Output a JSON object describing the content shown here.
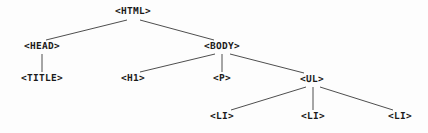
{
  "diagram": {
    "type": "tree",
    "width": 428,
    "height": 133,
    "background_color": "#fdfdfd",
    "line_color": "#3a3a3a",
    "text_color": "#1a1a1a",
    "nodes": [
      {
        "id": "html",
        "label": "<HTML>",
        "x": 133,
        "y": 12,
        "depth": 0
      },
      {
        "id": "head",
        "label": "<HEAD>",
        "x": 42,
        "y": 47,
        "depth": 1
      },
      {
        "id": "body",
        "label": "<BODY>",
        "x": 222,
        "y": 47,
        "depth": 1
      },
      {
        "id": "title",
        "label": "<TITLE>",
        "x": 42,
        "y": 79,
        "depth": 2
      },
      {
        "id": "h1",
        "label": "<H1>",
        "x": 133,
        "y": 79,
        "depth": 2
      },
      {
        "id": "p",
        "label": "<P>",
        "x": 222,
        "y": 79,
        "depth": 2
      },
      {
        "id": "ul",
        "label": "<UL>",
        "x": 312,
        "y": 80,
        "depth": 2
      },
      {
        "id": "li1",
        "label": "<LI>",
        "x": 222,
        "y": 117,
        "depth": 3
      },
      {
        "id": "li2",
        "label": "<LI>",
        "x": 313,
        "y": 117,
        "depth": 3
      },
      {
        "id": "li3",
        "label": "<LI>",
        "x": 400,
        "y": 117,
        "depth": 3
      }
    ],
    "edges": [
      {
        "from": "html",
        "to": "head",
        "x1": 127,
        "y1": 20,
        "x2": 46,
        "y2": 40
      },
      {
        "from": "html",
        "to": "body",
        "x1": 140,
        "y1": 20,
        "x2": 214,
        "y2": 40
      },
      {
        "from": "head",
        "to": "title",
        "x1": 42,
        "y1": 54,
        "x2": 42,
        "y2": 72
      },
      {
        "from": "body",
        "to": "h1",
        "x1": 215,
        "y1": 54,
        "x2": 140,
        "y2": 72
      },
      {
        "from": "body",
        "to": "p",
        "x1": 222,
        "y1": 54,
        "x2": 222,
        "y2": 72
      },
      {
        "from": "body",
        "to": "ul",
        "x1": 230,
        "y1": 54,
        "x2": 304,
        "y2": 73
      },
      {
        "from": "ul",
        "to": "li1",
        "x1": 306,
        "y1": 87,
        "x2": 231,
        "y2": 110
      },
      {
        "from": "ul",
        "to": "li2",
        "x1": 313,
        "y1": 87,
        "x2": 313,
        "y2": 110
      },
      {
        "from": "ul",
        "to": "li3",
        "x1": 320,
        "y1": 87,
        "x2": 393,
        "y2": 110
      }
    ]
  }
}
